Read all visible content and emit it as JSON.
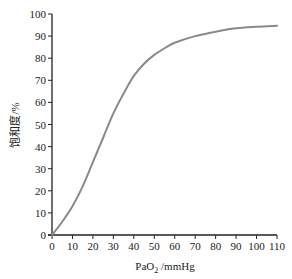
{
  "chart_data": {
    "type": "line",
    "title": "",
    "xlabel": "PaO2 /mmHg",
    "xlabel_main": "PaO",
    "xlabel_sub": "2",
    "xlabel_unit": " /mmHg",
    "ylabel": "饱和度/%",
    "xlim": [
      0,
      110
    ],
    "ylim": [
      0,
      100
    ],
    "grid": false,
    "legend": null,
    "x_ticks": [
      0,
      10,
      20,
      30,
      40,
      50,
      60,
      70,
      80,
      90,
      100,
      110
    ],
    "y_ticks": [
      0,
      10,
      20,
      30,
      40,
      50,
      60,
      70,
      80,
      90,
      100
    ],
    "series": [
      {
        "name": "O2 saturation",
        "color": "#8a8a8a",
        "x": [
          0,
          5,
          10,
          15,
          20,
          25,
          30,
          35,
          40,
          45,
          50,
          55,
          60,
          70,
          80,
          90,
          100,
          110
        ],
        "y": [
          0,
          6,
          13,
          22,
          33,
          44,
          55,
          64,
          72,
          77.5,
          81.5,
          84.5,
          87,
          90,
          92,
          93.5,
          94.2,
          94.7
        ]
      }
    ]
  }
}
